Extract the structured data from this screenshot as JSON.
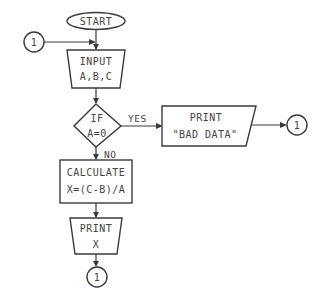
{
  "diagram": {
    "type": "flowchart",
    "nodes": {
      "start": {
        "shape": "terminal",
        "label": "START"
      },
      "input": {
        "shape": "manual-input",
        "line1": "INPUT",
        "line2": "A,B,C"
      },
      "decision": {
        "shape": "decision",
        "line1": "IF",
        "line2": "A=0"
      },
      "print_bad": {
        "shape": "output",
        "line1": "PRINT",
        "line2": "\"BAD DATA\""
      },
      "calculate": {
        "shape": "process",
        "line1": "CALCULATE",
        "line2": "X=(C-B)/A"
      },
      "print_x": {
        "shape": "manual-input",
        "line1": "PRINT",
        "line2": "X"
      },
      "connector_in": {
        "shape": "connector",
        "label": "1"
      },
      "connector_yes": {
        "shape": "connector",
        "label": "1"
      },
      "connector_out": {
        "shape": "connector",
        "label": "1"
      }
    },
    "edges": {
      "yes_label": "YES",
      "no_label": "NO"
    },
    "colors": {
      "stroke": "#3a3a3a",
      "text": "#444444",
      "background": "#ffffff"
    }
  }
}
